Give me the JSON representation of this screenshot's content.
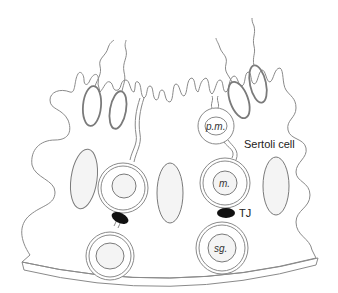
{
  "diagram": {
    "labels": {
      "pm": "p.m.",
      "sertoli": "Sertoli cell",
      "m": "m.",
      "tj": "TJ",
      "sg": "sg."
    },
    "colors": {
      "stroke": "#8a8a8a",
      "tight_junction": "#111111",
      "nucleus_fill": "#f4f4f4",
      "label_text": "#222222"
    }
  }
}
